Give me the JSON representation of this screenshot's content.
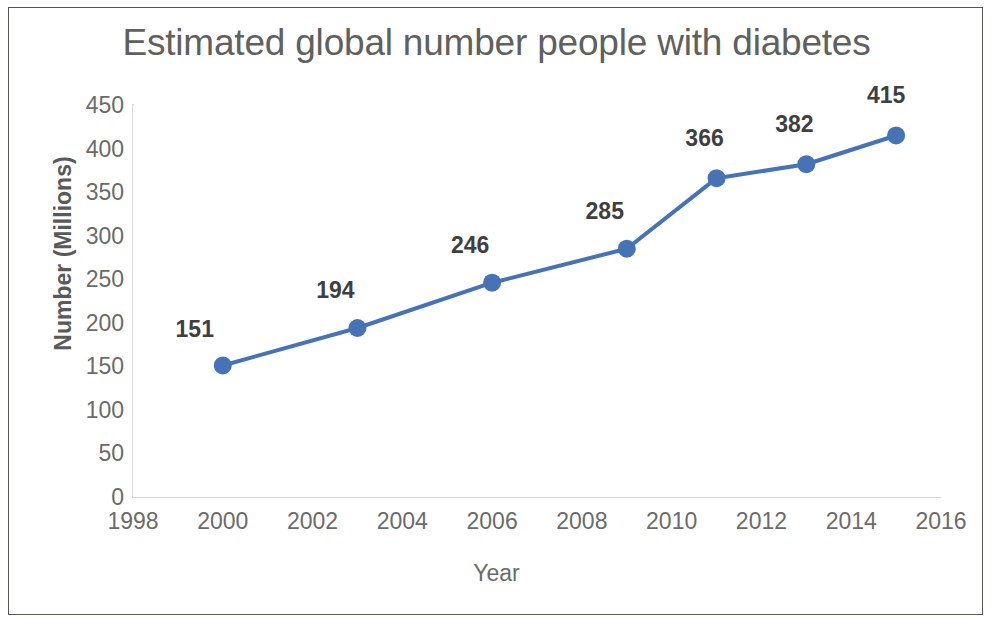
{
  "chart_data": {
    "type": "line",
    "title": "Estimated global number people with diabetes",
    "xlabel": "Year",
    "ylabel": "Number (Millions)",
    "x": [
      2000,
      2003,
      2006,
      2009,
      2011,
      2013,
      2015
    ],
    "values": [
      151,
      194,
      246,
      285,
      366,
      382,
      415
    ],
    "data_labels": [
      "151",
      "194",
      "246",
      "285",
      "366",
      "382",
      "415"
    ],
    "xlim": [
      1998,
      2016
    ],
    "ylim": [
      0,
      450
    ],
    "xticks": [
      1998,
      2000,
      2002,
      2004,
      2006,
      2008,
      2010,
      2012,
      2014,
      2016
    ],
    "xtick_labels": [
      "1998",
      "2000",
      "2002",
      "2004",
      "2006",
      "2008",
      "2010",
      "2012",
      "2014",
      "2016"
    ],
    "yticks": [
      0,
      50,
      100,
      150,
      200,
      250,
      300,
      350,
      400,
      450
    ],
    "ytick_labels": [
      "0",
      "50",
      "100",
      "150",
      "200",
      "250",
      "300",
      "350",
      "400",
      "450"
    ],
    "grid": false,
    "legend": false,
    "series_color": "#4573b5",
    "marker": "circle",
    "marker_size": 9,
    "line_width": 4,
    "title_color": "#60605e",
    "axis_color": "#d9d9d9",
    "tick_label_color": "#6b6b69",
    "data_label_color": "#3f3f3f",
    "border_color": "#585450",
    "background": "#ffffff"
  }
}
